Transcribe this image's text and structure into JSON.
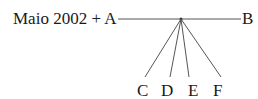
{
  "diagram": {
    "type": "fan-tree",
    "root_label": "Maio 2002 + A",
    "end_label": "B",
    "branch_labels": [
      "C",
      "D",
      "E",
      "F"
    ],
    "colors": {
      "text": "#1a1a1a",
      "line": "#555555",
      "background": "#ffffff"
    }
  }
}
